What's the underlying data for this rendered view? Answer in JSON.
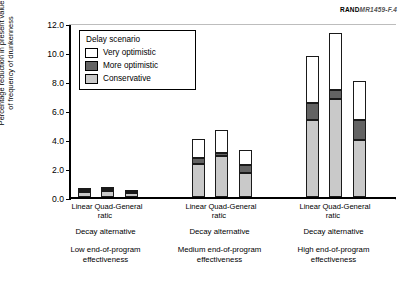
{
  "figure": {
    "rand_tag_prefix": "RAND",
    "rand_tag_number": "MR1459-F.4"
  },
  "chart_data": {
    "type": "bar",
    "subtype": "stacked-bar",
    "title": "",
    "xlabel": "Decay alternative",
    "ylabel": "Percentage reduction in present value of frequency of drunkenness",
    "ylim": [
      0.0,
      12.0
    ],
    "yticks": [
      "0.0",
      "2.0",
      "4.0",
      "6.0",
      "8.0",
      "10.0",
      "12.0"
    ],
    "ytick_values": [
      0.0,
      2.0,
      4.0,
      6.0,
      8.0,
      10.0,
      12.0
    ],
    "grid": false,
    "legend_title": "Delay scenario",
    "legend_position": "upper-left-inside",
    "series": [
      {
        "name": "Conservative",
        "color": "#c9c9c9",
        "values": [
          0.35,
          0.42,
          0.28,
          2.25,
          2.8,
          1.65,
          5.3,
          6.75,
          3.9
        ]
      },
      {
        "name": "More optimistic",
        "color": "#636363",
        "values": [
          0.12,
          0.13,
          0.09,
          0.45,
          0.25,
          0.55,
          1.2,
          0.6,
          1.4
        ]
      },
      {
        "name": "Very optimistic",
        "color": "#ffffff",
        "values": [
          0.08,
          0.1,
          0.05,
          1.3,
          1.55,
          1.05,
          3.2,
          3.95,
          2.7
        ]
      }
    ],
    "categories": [
      "Linear",
      "Quad-ratic",
      "General",
      "Linear",
      "Quad-ratic",
      "General",
      "Linear",
      "Quad-ratic",
      "General"
    ],
    "totals": [
      0.55,
      0.65,
      0.42,
      4.0,
      4.6,
      3.25,
      9.7,
      11.3,
      8.0
    ],
    "groups": [
      {
        "axis_label": "Decay alternative",
        "caption_line1": "Low end-of-program",
        "caption_line2": "effectiveness"
      },
      {
        "axis_label": "Decay alternative",
        "caption_line1": "Medium end-of-program",
        "caption_line2": "effectiveness"
      },
      {
        "axis_label": "Decay alternative",
        "caption_line1": "High end-of-program",
        "caption_line2": "effectiveness"
      }
    ]
  },
  "legend": {
    "title": "Delay scenario",
    "items": [
      {
        "label": "Very optimistic",
        "swatch": "white"
      },
      {
        "label": "More optimistic",
        "swatch": "dark-gray"
      },
      {
        "label": "Conservative",
        "swatch": "light-gray"
      }
    ]
  },
  "axis": {
    "y_title_line1": "Percentage reduction in present value",
    "y_title_line2": "of frequency of drunkenness",
    "tick_labels": [
      "12.0",
      "10.0",
      "8.0",
      "6.0",
      "4.0",
      "2.0",
      "0.0"
    ]
  },
  "bar_labels": [
    {
      "line1": "Linear",
      "line2": ""
    },
    {
      "line1": "Quad-",
      "line2": "ratic"
    },
    {
      "line1": "General",
      "line2": ""
    },
    {
      "line1": "Linear",
      "line2": ""
    },
    {
      "line1": "Quad-",
      "line2": "ratic"
    },
    {
      "line1": "General",
      "line2": ""
    },
    {
      "line1": "Linear",
      "line2": ""
    },
    {
      "line1": "Quad-",
      "line2": "ratic"
    },
    {
      "line1": "General",
      "line2": ""
    }
  ]
}
